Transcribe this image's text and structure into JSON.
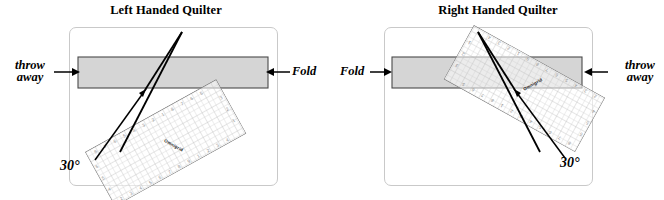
{
  "figure": {
    "background_color": "#ffffff",
    "fabric_color": "#d5d5d5",
    "fabric_stroke": "#4a4a4a",
    "ruler_grid_color": "#b4b4b4",
    "line_color": "#000000",
    "frame_color": "#c9c9c9"
  },
  "panels": [
    {
      "id": "left-handed",
      "title": "Left Handed Quilter",
      "labels": {
        "throw_away_line1": "throw",
        "throw_away_line2": "away",
        "fold": "Fold",
        "angle": "30°"
      },
      "ruler_brand": "Omnigrid",
      "arrows": {
        "throw_away_direction": "right",
        "fold_direction": "left"
      }
    },
    {
      "id": "right-handed",
      "title": "Right Handed Quilter",
      "labels": {
        "fold": "Fold",
        "throw_away_line1": "throw",
        "throw_away_line2": "away",
        "angle": "30°"
      },
      "ruler_brand": "Omnigrid",
      "arrows": {
        "fold_direction": "right",
        "throw_away_direction": "left"
      }
    }
  ]
}
